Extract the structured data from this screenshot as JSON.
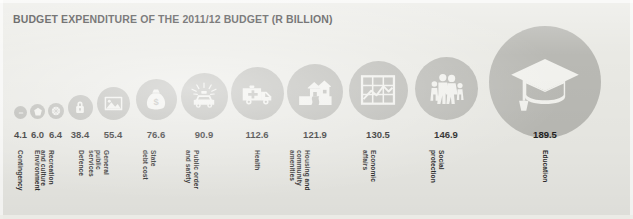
{
  "title": "BUDGET EXPENDITURE OF THE 2011/12 BUDGET (R BILLION)",
  "colors": {
    "background": "#e9e9e4",
    "circle": "#b9b9b4",
    "icon": "#f2f2ee",
    "text": "#1f1f1f"
  },
  "chart_data": {
    "type": "bar",
    "title": "BUDGET EXPENDITURE OF THE 2011/12 BUDGET (R BILLION)",
    "xlabel": "",
    "ylabel": "R Billion",
    "unit": "R Billion",
    "categories": [
      "Contingency",
      "Environment",
      "Recreation and culture",
      "Defence",
      "General public services",
      "State debt cost",
      "Public order and safety",
      "Health",
      "Housing and community amenities",
      "Economic affairs",
      "Social protection",
      "Education"
    ],
    "values": [
      4.1,
      6.0,
      6.4,
      38.4,
      55.4,
      76.6,
      90.9,
      112.6,
      121.9,
      130.5,
      146.9,
      189.5
    ],
    "encoding": "circle area proportional to value",
    "legend": "none",
    "grid": false
  },
  "items": [
    {
      "value": "4.1",
      "label_lines": [
        "Contingency"
      ],
      "icon": "dash-icon",
      "cx": 20.5,
      "cy": 112.5,
      "r": 6.5,
      "value_x": 20.5,
      "label_x": 24,
      "label_y": 150
    },
    {
      "value": "6.0",
      "label_lines": [
        "Environment"
      ],
      "icon": "leaf-icon",
      "cx": 37.5,
      "cy": 111.5,
      "r": 7.5,
      "value_x": 37.5,
      "label_x": 41,
      "label_y": 150
    },
    {
      "value": "6.4",
      "label_lines": [
        "Recreation",
        "and culture"
      ],
      "icon": "ball-icon",
      "cx": 55.5,
      "cy": 111.0,
      "r": 8.0,
      "value_x": 55.5,
      "label_x": 55,
      "label_y": 150
    },
    {
      "value": "38.4",
      "label_lines": [
        "Defence"
      ],
      "icon": "padlock-icon",
      "cx": 80.0,
      "cy": 107.0,
      "r": 12.5,
      "value_x": 80.0,
      "label_x": 85,
      "label_y": 150
    },
    {
      "value": "55.4",
      "label_lines": [
        "General",
        "public",
        "services"
      ],
      "icon": "landscape-picture-icon",
      "cx": 113.0,
      "cy": 103.5,
      "r": 16.5,
      "value_x": 113.0,
      "label_x": 110,
      "label_y": 150
    },
    {
      "value": "76.6",
      "label_lines": [
        "State",
        "debt cost"
      ],
      "icon": "money-bag-icon",
      "cx": 156.0,
      "cy": 99.5,
      "r": 20.5,
      "value_x": 156.0,
      "label_x": 157,
      "label_y": 150
    },
    {
      "value": "90.9",
      "label_lines": [
        "Public order",
        "and safety"
      ],
      "icon": "police-car-icon",
      "cx": 204.0,
      "cy": 96.5,
      "r": 23.5,
      "value_x": 204.0,
      "label_x": 200,
      "label_y": 150
    },
    {
      "value": "112.6",
      "label_lines": [
        "Health"
      ],
      "icon": "ambulance-icon",
      "cx": 257.0,
      "cy": 93.0,
      "r": 26.5,
      "value_x": 257.0,
      "label_x": 261,
      "label_y": 150
    },
    {
      "value": "121.9",
      "label_lines": [
        "Housing and",
        "community",
        "amenities"
      ],
      "icon": "houses-icon",
      "cx": 315.0,
      "cy": 91.5,
      "r": 28.0,
      "value_x": 315.0,
      "label_x": 311,
      "label_y": 150
    },
    {
      "value": "130.5",
      "label_lines": [
        "Economic",
        "affairs"
      ],
      "icon": "line-chart-icon",
      "cx": 378.0,
      "cy": 90.0,
      "r": 29.5,
      "value_x": 378.0,
      "label_x": 377,
      "label_y": 150
    },
    {
      "value": "146.9",
      "label_lines": [
        "Social",
        "protection"
      ],
      "icon": "family-icon",
      "cx": 446.0,
      "cy": 88.0,
      "r": 31.5,
      "value_x": 446.0,
      "label_x": 445,
      "label_y": 150
    },
    {
      "value": "189.5",
      "label_lines": [
        "Education"
      ],
      "icon": "graduation-cap-icon",
      "cx": 545.0,
      "cy": 82.0,
      "r": 56.0,
      "value_x": 545.0,
      "label_x": 549,
      "label_y": 150
    }
  ]
}
